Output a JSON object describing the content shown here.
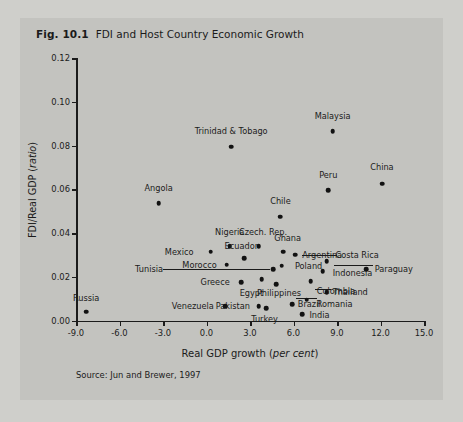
{
  "figure": {
    "number": "Fig. 10.1",
    "title": "FDI and Host Country Economic Growth",
    "source": "Source: Jun and Brewer, 1997"
  },
  "chart_data": {
    "type": "scatter",
    "title": "FDI and Host Country Economic Growth",
    "xlabel": "Real GDP growth (per cent)",
    "ylabel": "FDI/Real GDP (ratio)",
    "xlim": [
      -9.0,
      15.0
    ],
    "ylim": [
      0.0,
      0.12
    ],
    "xticks": [
      "-9.0",
      "-6.0",
      "-3.0",
      "0.0",
      "3.0",
      "6.0",
      "9.0",
      "12.0",
      "15.0"
    ],
    "xtick_values": [
      -9.0,
      -6.0,
      -3.0,
      0.0,
      3.0,
      6.0,
      9.0,
      12.0,
      15.0
    ],
    "yticks": [
      "0.00",
      "0.02",
      "0.04",
      "0.06",
      "0.08",
      "0.10",
      "0.12"
    ],
    "ytick_values": [
      0.0,
      0.02,
      0.04,
      0.06,
      0.08,
      0.1,
      0.12
    ],
    "grid": false,
    "legend": "none",
    "points": [
      {
        "label": "Russia",
        "x": -8.3,
        "y": 0.004,
        "lx": -8.3,
        "ly": 0.0105,
        "anchor": "center"
      },
      {
        "label": "Angola",
        "x": -3.3,
        "y": 0.0535,
        "lx": -3.3,
        "ly": 0.0605,
        "anchor": "center"
      },
      {
        "label": "Trinidad & Tobago",
        "x": 1.7,
        "y": 0.0795,
        "lx": 1.7,
        "ly": 0.0865,
        "anchor": "center"
      },
      {
        "label": "Malaysia",
        "x": 8.7,
        "y": 0.0865,
        "lx": 8.7,
        "ly": 0.0935,
        "anchor": "center"
      },
      {
        "label": "Peru",
        "x": 8.4,
        "y": 0.0595,
        "lx": 8.4,
        "ly": 0.0665,
        "anchor": "center"
      },
      {
        "label": "China",
        "x": 12.1,
        "y": 0.0625,
        "lx": 12.1,
        "ly": 0.07,
        "anchor": "center"
      },
      {
        "label": "Chile",
        "x": 5.1,
        "y": 0.0475,
        "lx": 5.1,
        "ly": 0.0545,
        "anchor": "center"
      },
      {
        "label": "Nigeria",
        "x": 1.6,
        "y": 0.034,
        "lx": 1.6,
        "ly": 0.0405,
        "anchor": "center"
      },
      {
        "label": "Czech. Rep.",
        "x": 3.6,
        "y": 0.034,
        "lx": 3.9,
        "ly": 0.0405,
        "anchor": "center"
      },
      {
        "label": "Mexico",
        "x": 0.3,
        "y": 0.0315,
        "lx": -0.9,
        "ly": 0.0315,
        "anchor": "end"
      },
      {
        "label": "Ghana",
        "x": 5.3,
        "y": 0.0315,
        "lx": 5.6,
        "ly": 0.0375,
        "anchor": "center"
      },
      {
        "label": "Ecuador",
        "x": 2.6,
        "y": 0.0285,
        "lx": 2.4,
        "ly": 0.034,
        "anchor": "center"
      },
      {
        "label": "Argentina",
        "x": 6.1,
        "y": 0.03,
        "lx": 6.6,
        "ly": 0.03,
        "anchor": "start"
      },
      {
        "label": "Costa Rica",
        "x": 8.3,
        "y": 0.027,
        "lx": 8.9,
        "ly": 0.03,
        "anchor": "start"
      },
      {
        "label": "Morocco",
        "x": 1.4,
        "y": 0.0255,
        "lx": 0.7,
        "ly": 0.0255,
        "anchor": "end"
      },
      {
        "label": "Poland",
        "x": 5.2,
        "y": 0.025,
        "lx": 6.1,
        "ly": 0.025,
        "anchor": "start"
      },
      {
        "label": "Tunisia",
        "x": 4.6,
        "y": 0.0235,
        "lx": -3.0,
        "ly": 0.0235,
        "anchor": "end"
      },
      {
        "label": "Indonesia",
        "x": 8.0,
        "y": 0.0225,
        "lx": 8.7,
        "ly": 0.0215,
        "anchor": "start"
      },
      {
        "label": "Paraguay",
        "x": 11.0,
        "y": 0.0235,
        "lx": 11.6,
        "ly": 0.0235,
        "anchor": "start"
      },
      {
        "label": "Greece",
        "x": 2.4,
        "y": 0.0175,
        "lx": 1.6,
        "ly": 0.0175,
        "anchor": "end"
      },
      {
        "label": "Egypt",
        "x": 3.8,
        "y": 0.019,
        "lx": 3.1,
        "ly": 0.0128,
        "anchor": "center"
      },
      {
        "label": "Philippines",
        "x": 4.8,
        "y": 0.0165,
        "lx": 5.0,
        "ly": 0.0128,
        "anchor": "center"
      },
      {
        "label": "Colombia",
        "x": 7.2,
        "y": 0.018,
        "lx": 7.6,
        "ly": 0.0135,
        "anchor": "start"
      },
      {
        "label": "Thailand",
        "x": 8.3,
        "y": 0.013,
        "lx": 8.7,
        "ly": 0.013,
        "anchor": "start"
      },
      {
        "label": "Romania",
        "x": 6.9,
        "y": 0.0095,
        "lx": 7.6,
        "ly": 0.0075,
        "anchor": "start"
      },
      {
        "label": "Venezuela",
        "x": 1.3,
        "y": 0.0065,
        "lx": 0.5,
        "ly": 0.0065,
        "anchor": "end"
      },
      {
        "label": "Pakistan",
        "x": 3.6,
        "y": 0.0065,
        "lx": 3.0,
        "ly": 0.0065,
        "anchor": "end"
      },
      {
        "label": "Brazil",
        "x": 5.9,
        "y": 0.0075,
        "lx": 6.3,
        "ly": 0.0075,
        "anchor": "start"
      },
      {
        "label": "Turkey",
        "x": 4.1,
        "y": 0.0055,
        "lx": 4.0,
        "ly": 0.0005,
        "anchor": "center"
      },
      {
        "label": "India",
        "x": 6.6,
        "y": 0.003,
        "lx": 7.1,
        "ly": 0.0025,
        "anchor": "start"
      }
    ],
    "leaders": [
      {
        "x1": -3.0,
        "y1": 0.0235,
        "x2": 4.4,
        "y2": 0.0235
      },
      {
        "x1": 6.6,
        "y1": 0.03,
        "x2": 9.0,
        "y2": 0.03
      },
      {
        "x1": 8.8,
        "y1": 0.0253,
        "x2": 11.5,
        "y2": 0.0253
      },
      {
        "x1": 7.5,
        "y1": 0.0143,
        "x2": 8.6,
        "y2": 0.0143
      },
      {
        "x1": 6.2,
        "y1": 0.0105,
        "x2": 7.6,
        "y2": 0.0105
      }
    ]
  }
}
